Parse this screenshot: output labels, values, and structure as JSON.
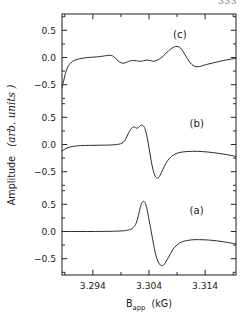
{
  "page": {
    "page_number": "333"
  },
  "figure": {
    "frame": {
      "left": 62,
      "top": 14,
      "right": 236,
      "bottom": 275
    },
    "line_color": "#2b2b2b",
    "axis_color": "#2b2b2b"
  },
  "axes": {
    "y_axis_label_main": "Amplitude",
    "y_axis_label_units": "(arb. units )",
    "x_axis_label_main": "B",
    "x_axis_label_sub": "app",
    "x_axis_label_units": "(kG)"
  },
  "trace_labels": {
    "a": "(a)",
    "b": "(b)",
    "c": "(c)"
  },
  "y_tick_labels": [
    "0.5",
    "0.0",
    "−0.5"
  ],
  "x_tick_labels": [
    "3.294",
    "3.304",
    "3.314"
  ],
  "chart_data": {
    "type": "line",
    "title": "",
    "xlabel": "B_app (kG)",
    "ylabel": "Amplitude (arb. units)",
    "xlim": [
      3.2885,
      3.3195
    ],
    "x_major_ticks": [
      3.294,
      3.304,
      3.314
    ],
    "x_minor_ticks": [
      3.289,
      3.299,
      3.309,
      3.319
    ],
    "grid": false,
    "legend_position": "inline-annotations",
    "stacked_panels": true,
    "panel_count": 3,
    "panel_ylim": [
      -0.8,
      0.8
    ],
    "panel_y_ticks": [
      0.5,
      0.0,
      -0.5
    ],
    "series": [
      {
        "name": "(a)",
        "panel": 1,
        "panel_label": "(a)",
        "panel_label_x": 3.3125,
        "panel_label_y": 0.38,
        "description": "Clean first-derivative EPR lineshape, single resonance",
        "x": [
          3.2885,
          3.29,
          3.2915,
          3.293,
          3.2945,
          3.296,
          3.2975,
          3.2985,
          3.2995,
          3.3,
          3.3005,
          3.301,
          3.3014,
          3.3018,
          3.3021,
          3.3024,
          3.3027,
          3.303,
          3.3033,
          3.3036,
          3.3039,
          3.3042,
          3.3045,
          3.3048,
          3.3051,
          3.3054,
          3.3058,
          3.3062,
          3.3066,
          3.307,
          3.3075,
          3.3082,
          3.309,
          3.31,
          3.3115,
          3.313,
          3.315,
          3.317,
          3.3195
        ],
        "y": [
          0.0,
          0.0,
          0.0,
          0.0,
          0.001,
          0.002,
          0.004,
          0.007,
          0.013,
          0.02,
          0.032,
          0.055,
          0.095,
          0.175,
          0.29,
          0.42,
          0.52,
          0.555,
          0.53,
          0.43,
          0.28,
          0.11,
          -0.06,
          -0.23,
          -0.38,
          -0.5,
          -0.59,
          -0.628,
          -0.615,
          -0.56,
          -0.47,
          -0.34,
          -0.245,
          -0.185,
          -0.155,
          -0.15,
          -0.16,
          -0.185,
          -0.23
        ]
      },
      {
        "name": "(b)",
        "panel": 2,
        "panel_label": "(b)",
        "panel_label_x": 3.3125,
        "panel_label_y": 0.38,
        "description": "First-derivative lineshape with split / double-peaked positive lobe and broad baseline offset",
        "x": [
          3.2885,
          3.2892,
          3.29,
          3.2912,
          3.2925,
          3.294,
          3.2955,
          3.2968,
          3.2978,
          3.2986,
          3.2992,
          3.2997,
          3.3001,
          3.3005,
          3.3009,
          3.3013,
          3.3016,
          3.3019,
          3.3022,
          3.3025,
          3.3028,
          3.3031,
          3.3034,
          3.3037,
          3.304,
          3.3043,
          3.3046,
          3.3049,
          3.3052,
          3.3055,
          3.3058,
          3.3062,
          3.3067,
          3.3073,
          3.308,
          3.309,
          3.3102,
          3.3118,
          3.3135,
          3.3155,
          3.3175,
          3.3195
        ],
        "y": [
          -0.115,
          -0.075,
          -0.045,
          -0.025,
          -0.018,
          -0.015,
          -0.013,
          -0.01,
          -0.005,
          0.005,
          0.025,
          0.075,
          0.155,
          0.24,
          0.3,
          0.325,
          0.31,
          0.3,
          0.32,
          0.35,
          0.355,
          0.33,
          0.25,
          0.12,
          -0.06,
          -0.25,
          -0.41,
          -0.53,
          -0.6,
          -0.618,
          -0.595,
          -0.52,
          -0.41,
          -0.3,
          -0.22,
          -0.16,
          -0.135,
          -0.125,
          -0.13,
          -0.15,
          -0.18,
          -0.22
        ]
      },
      {
        "name": "(c)",
        "panel": 3,
        "panel_label": "(c)",
        "panel_label_x": 3.3095,
        "panel_label_y": 0.42,
        "description": "Low-amplitude structured / noisy trace with several small oscillatory features; sharp rise from negative value at left edge",
        "x": [
          3.2885,
          3.2889,
          3.2893,
          3.2898,
          3.2904,
          3.2912,
          3.2922,
          3.2934,
          3.2946,
          3.2956,
          3.2964,
          3.297,
          3.2975,
          3.2979,
          3.2983,
          3.2988,
          3.2994,
          3.3,
          3.3006,
          3.3012,
          3.3018,
          3.3024,
          3.303,
          3.3036,
          3.3042,
          3.3048,
          3.3054,
          3.306,
          3.3066,
          3.3072,
          3.3078,
          3.3084,
          3.309,
          3.3096,
          3.3101,
          3.3106,
          3.3111,
          3.3116,
          3.3121,
          3.3127,
          3.3134,
          3.3142,
          3.3152,
          3.3164,
          3.3178,
          3.3195
        ],
        "y": [
          -0.56,
          -0.38,
          -0.23,
          -0.13,
          -0.07,
          -0.035,
          -0.012,
          0.002,
          0.01,
          0.022,
          0.035,
          0.04,
          0.03,
          0.0,
          -0.045,
          -0.085,
          -0.105,
          -0.09,
          -0.065,
          -0.055,
          -0.06,
          -0.07,
          -0.06,
          -0.048,
          -0.055,
          -0.07,
          -0.052,
          -0.02,
          0.035,
          0.095,
          0.15,
          0.19,
          0.205,
          0.175,
          0.105,
          0.02,
          -0.065,
          -0.125,
          -0.16,
          -0.17,
          -0.155,
          -0.13,
          -0.105,
          -0.075,
          -0.045,
          -0.015
        ]
      }
    ]
  }
}
